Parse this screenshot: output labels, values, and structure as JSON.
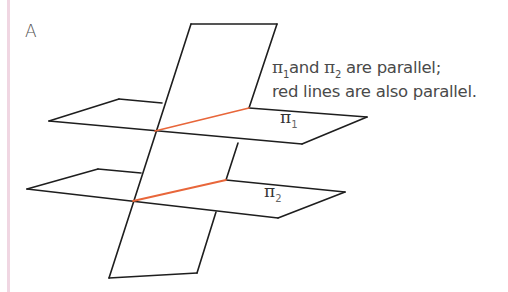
{
  "figure": {
    "panel_label": "A",
    "caption": {
      "line1": {
        "pi_a": "π",
        "sub_a": "1",
        "mid": "and ",
        "pi_b": "π",
        "sub_b": "2",
        "rest": " are parallel;"
      },
      "line2": "red lines are also parallel."
    },
    "planes": [
      {
        "name": "π1",
        "symbol": "π",
        "subscript": "1"
      },
      {
        "name": "π2",
        "symbol": "π",
        "subscript": "2"
      }
    ],
    "colors": {
      "outline": "#1e1e1e",
      "intersection_line": "#e8663a",
      "side_bar": "#f0d6e2",
      "text": "#4a4a4a"
    }
  }
}
